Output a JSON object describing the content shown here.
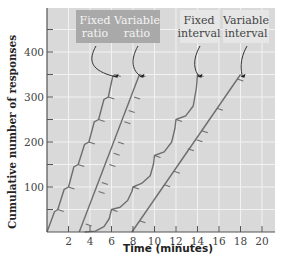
{
  "chart_data": {
    "type": "line",
    "title": "",
    "xlabel": "Time (minutes)",
    "ylabel": "Cumulative number of responses",
    "xlim": [
      0,
      21
    ],
    "ylim": [
      0,
      500
    ],
    "x_ticks": [
      2,
      4,
      6,
      8,
      10,
      12,
      14,
      16,
      18,
      20
    ],
    "y_ticks_labeled": [
      100,
      200,
      300,
      400
    ],
    "y_ticks_minor": [
      50,
      150,
      250,
      350,
      450
    ],
    "grid": true,
    "grid_x_step": 2,
    "grid_y_step": 50,
    "colors": {
      "plot_bg": "#d9d9d9",
      "grid": "#f2f2f2",
      "line": "#6e6e6e",
      "axis": "#555555",
      "ratio_label_bg": "#a9a9a9",
      "interval_label_bg": "#e6e6e6"
    },
    "series": [
      {
        "name": "Fixed ratio",
        "label_lines": [
          "Fixed",
          "ratio"
        ],
        "label_style": "dark",
        "points": [
          [
            0,
            0
          ],
          [
            0.7,
            45
          ],
          [
            1.0,
            50
          ],
          [
            1.6,
            95
          ],
          [
            2.0,
            100
          ],
          [
            2.5,
            145
          ],
          [
            2.9,
            150
          ],
          [
            3.5,
            195
          ],
          [
            3.9,
            200
          ],
          [
            4.4,
            245
          ],
          [
            4.8,
            250
          ],
          [
            5.3,
            295
          ],
          [
            5.7,
            300
          ],
          [
            6.1,
            345
          ],
          [
            6.3,
            350
          ]
        ],
        "reinforcement_marks": [
          [
            1.0,
            50
          ],
          [
            2.0,
            100
          ],
          [
            2.9,
            150
          ],
          [
            3.9,
            200
          ],
          [
            4.8,
            250
          ],
          [
            5.7,
            300
          ],
          [
            6.3,
            350
          ]
        ],
        "end_point": [
          6.1,
          345
        ]
      },
      {
        "name": "Variable ratio",
        "label_lines": [
          "Variable",
          "ratio"
        ],
        "label_style": "dark",
        "points": [
          [
            3.0,
            0
          ],
          [
            8.6,
            350
          ]
        ],
        "reinforcement_marks": [
          [
            3.6,
            18
          ],
          [
            4.8,
            90
          ],
          [
            5.1,
            110
          ],
          [
            5.8,
            150
          ],
          [
            6.2,
            175
          ],
          [
            6.6,
            200
          ],
          [
            7.2,
            245
          ],
          [
            7.6,
            270
          ],
          [
            8.1,
            300
          ],
          [
            8.6,
            350
          ]
        ],
        "end_point": [
          8.5,
          345
        ]
      },
      {
        "name": "Fixed interval",
        "label_lines": [
          "Fixed",
          "interval"
        ],
        "label_style": "light",
        "points": [
          [
            3.5,
            0
          ],
          [
            4.5,
            2
          ],
          [
            5.3,
            12
          ],
          [
            5.8,
            30
          ],
          [
            6.0,
            50
          ],
          [
            6.8,
            55
          ],
          [
            7.5,
            70
          ],
          [
            7.9,
            90
          ],
          [
            8.0,
            100
          ],
          [
            8.8,
            108
          ],
          [
            9.6,
            125
          ],
          [
            9.9,
            150
          ],
          [
            10.0,
            170
          ],
          [
            10.9,
            178
          ],
          [
            11.6,
            200
          ],
          [
            11.9,
            230
          ],
          [
            12.0,
            250
          ],
          [
            12.9,
            258
          ],
          [
            13.6,
            280
          ],
          [
            13.9,
            320
          ],
          [
            14.0,
            350
          ]
        ],
        "reinforcement_marks": [
          [
            6.0,
            50
          ],
          [
            8.0,
            100
          ],
          [
            10.0,
            170
          ],
          [
            12.0,
            250
          ],
          [
            14.0,
            350
          ]
        ],
        "end_point": [
          13.9,
          345
        ]
      },
      {
        "name": "Variable interval",
        "label_lines": [
          "Variable",
          "interval"
        ],
        "label_style": "light",
        "points": [
          [
            7.9,
            0
          ],
          [
            18.0,
            350
          ]
        ],
        "reinforcement_marks": [
          [
            8.6,
            25
          ],
          [
            10.9,
            105
          ],
          [
            11.8,
            135
          ],
          [
            13.1,
            185
          ],
          [
            13.9,
            205
          ],
          [
            14.4,
            225
          ],
          [
            15.8,
            275
          ],
          [
            17.7,
            340
          ]
        ],
        "end_point": [
          17.9,
          345
        ]
      }
    ]
  }
}
